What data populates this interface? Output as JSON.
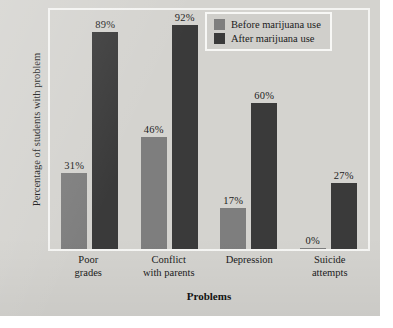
{
  "chart_data": {
    "type": "bar",
    "title": "",
    "xlabel": "Problems",
    "ylabel": "Percentage of students with problem",
    "categories": [
      "Poor grades",
      "Conflict with parents",
      "Depression",
      "Suicide attempts"
    ],
    "category_lines": [
      [
        "Poor",
        "grades"
      ],
      [
        "Conflict",
        "with parents"
      ],
      [
        "Depression",
        ""
      ],
      [
        "Suicide",
        "attempts"
      ]
    ],
    "series": [
      {
        "name": "Before marijuana use",
        "color": "#7e7e7e",
        "values": [
          31,
          46,
          17,
          0
        ],
        "labels": [
          "31%",
          "46%",
          "17%",
          "0%"
        ]
      },
      {
        "name": "After marijuana use",
        "color": "#3a3a3a",
        "values": [
          89,
          92,
          60,
          27
        ],
        "labels": [
          "89%",
          "92%",
          "60%",
          "27%"
        ]
      }
    ],
    "ylim": [
      0,
      100
    ],
    "grid": false,
    "y_ticks_shown": false,
    "legend_position": "top-right"
  },
  "legend": {
    "items": [
      {
        "label": "Before marijuana use",
        "swatch": "before"
      },
      {
        "label": "After marijuana use",
        "swatch": "after"
      }
    ]
  },
  "colors": {
    "before": "#7e7e7e",
    "after": "#3a3a3a",
    "panel": "#d4d3cf",
    "frame": "#f4f4f2",
    "text": "#1b1b1b"
  }
}
